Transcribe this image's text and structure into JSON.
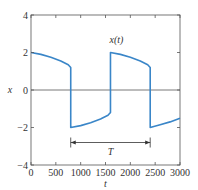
{
  "chart_data": {
    "type": "line",
    "title": "",
    "xlabel": "t",
    "ylabel": "x",
    "xlim": [
      0,
      3000
    ],
    "ylim": [
      -4,
      4
    ],
    "xticks": [
      0,
      500,
      1000,
      1500,
      2000,
      2500,
      3000
    ],
    "yticks": [
      -4,
      -2,
      0,
      2,
      4
    ],
    "xtick_labels": [
      "0",
      "500",
      "1000",
      "1500",
      "2000",
      "2500",
      "3000"
    ],
    "ytick_labels": [
      "−4",
      "−2",
      "0",
      "2",
      "4"
    ],
    "grid": false,
    "zero_line": true,
    "series": [
      {
        "name": "x(t)",
        "color": "#3a86c8",
        "points": [
          [
            0,
            2.0
          ],
          [
            200,
            1.9
          ],
          [
            400,
            1.75
          ],
          [
            600,
            1.55
          ],
          [
            750,
            1.35
          ],
          [
            800,
            1.2
          ],
          [
            800,
            -2.0
          ],
          [
            1000,
            -1.9
          ],
          [
            1200,
            -1.75
          ],
          [
            1400,
            -1.55
          ],
          [
            1550,
            -1.35
          ],
          [
            1600,
            -1.2
          ],
          [
            1600,
            2.0
          ],
          [
            1800,
            1.9
          ],
          [
            2000,
            1.75
          ],
          [
            2200,
            1.55
          ],
          [
            2350,
            1.35
          ],
          [
            2400,
            1.2
          ],
          [
            2400,
            -2.0
          ],
          [
            2600,
            -1.85
          ],
          [
            2800,
            -1.7
          ],
          [
            3000,
            -1.5
          ]
        ]
      }
    ],
    "annotations": [
      {
        "text": "x(t)",
        "x": 1720,
        "y": 2.5
      },
      {
        "text": "T",
        "type": "double-arrow",
        "x_start": 800,
        "x_end": 2400,
        "y": -2.8,
        "label_y": -3.3
      }
    ],
    "legend": null
  }
}
